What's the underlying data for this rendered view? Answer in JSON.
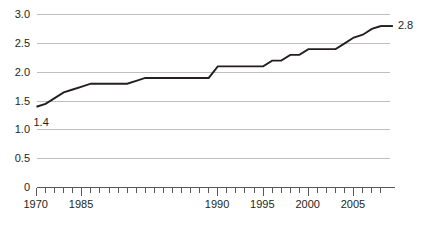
{
  "chart_data": {
    "type": "line",
    "title": "",
    "xlabel": "",
    "ylabel": "",
    "x": [
      1970,
      1971,
      1972,
      1973,
      1974,
      1975,
      1976,
      1977,
      1978,
      1979,
      1980,
      1981,
      1982,
      1983,
      1984,
      1985,
      1986,
      1987,
      1988,
      1989,
      1990,
      1991,
      1992,
      1993,
      1994,
      1995,
      1996,
      1997,
      1998,
      1999,
      2000,
      2001,
      2002,
      2003,
      2004,
      2005,
      2006,
      2007,
      2008
    ],
    "values": [
      1.4,
      1.45,
      1.55,
      1.65,
      1.7,
      1.75,
      1.8,
      1.8,
      1.8,
      1.8,
      1.8,
      1.85,
      1.9,
      1.9,
      1.9,
      1.9,
      1.9,
      1.9,
      1.9,
      1.9,
      2.1,
      2.1,
      2.1,
      2.1,
      2.1,
      2.1,
      2.2,
      2.2,
      2.3,
      2.3,
      2.4,
      2.4,
      2.4,
      2.4,
      2.5,
      2.6,
      2.65,
      2.75,
      2.8
    ],
    "series": [
      {
        "name": "value",
        "values": [
          1.4,
          1.45,
          1.55,
          1.65,
          1.7,
          1.75,
          1.8,
          1.8,
          1.8,
          1.8,
          1.8,
          1.85,
          1.9,
          1.9,
          1.9,
          1.9,
          1.9,
          1.9,
          1.9,
          1.9,
          2.1,
          2.1,
          2.1,
          2.1,
          2.1,
          2.1,
          2.2,
          2.2,
          2.3,
          2.3,
          2.4,
          2.4,
          2.4,
          2.4,
          2.5,
          2.6,
          2.65,
          2.75,
          2.8
        ]
      }
    ],
    "ylim": [
      0,
      3.0
    ],
    "xlim": [
      1970,
      2009
    ],
    "ytick_labels": [
      "3.0",
      "2.5",
      "2.0",
      "1.5",
      "1.0",
      "0.5",
      "0"
    ],
    "ytick_values": [
      3.0,
      2.5,
      2.0,
      1.5,
      1.0,
      0.5,
      0
    ],
    "xtick_labels": [
      "1970",
      "1985",
      "1990",
      "1995",
      "2000",
      "2005"
    ],
    "xtick_values": [
      1970,
      1975,
      1990,
      1995,
      2000,
      2005
    ],
    "annotations": [
      {
        "text": "1.4",
        "x": 1970,
        "y": 1.4
      },
      {
        "text": "2.8",
        "x": 2008,
        "y": 2.8
      }
    ],
    "grid": true,
    "legend": "none",
    "line_color": "#231f20",
    "grid_color": "#bcbec0",
    "axis_color": "#58595b",
    "background_color": "#ffffff"
  }
}
